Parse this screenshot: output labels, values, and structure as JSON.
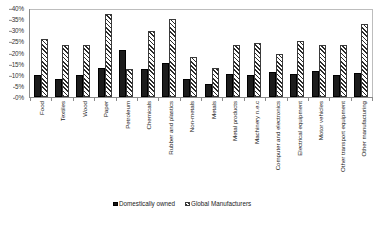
{
  "chart_data": {
    "type": "bar",
    "title": "",
    "subtitle": "",
    "xlabel": "",
    "ylabel": "",
    "ylim": [
      0,
      40
    ],
    "ytick_step": 5,
    "ytick_labels": [
      "0%",
      "5%",
      "10%",
      "15%",
      "20%",
      "25%",
      "30%",
      "35%",
      "40%"
    ],
    "ytick_values": [
      0,
      5,
      10,
      15,
      20,
      25,
      30,
      35,
      40
    ],
    "grid": false,
    "legend_position": "bottom",
    "value_unit": "%",
    "categories": [
      "Food",
      "Textiles",
      "Wood",
      "Paper",
      "Petroleum",
      "Chemicals",
      "Rubber and plastics",
      "Non-metals",
      "Metals",
      "Metal products",
      "Machinery n.e.c",
      "Computer and electronics",
      "Electrical equipment",
      "Motor vehicles",
      "Other transport equipment",
      "Other manufacturing"
    ],
    "series": [
      {
        "name": "Domestically owned",
        "pattern": "solid",
        "color": "#1c1c1c",
        "values": [
          9.8,
          8.3,
          10.1,
          12.9,
          21.1,
          12.4,
          15.5,
          8.2,
          5.8,
          10.4,
          10.0,
          11.3,
          10.2,
          11.6,
          10.1,
          10.6
        ]
      },
      {
        "name": "Global Manufacturers",
        "pattern": "diagonal-hatch",
        "color": "#2b2b2b",
        "values": [
          26.2,
          23.4,
          23.4,
          37.4,
          12.5,
          29.6,
          35.0,
          18.0,
          12.9,
          23.3,
          24.1,
          19.4,
          25.1,
          23.4,
          23.5,
          32.8
        ]
      }
    ]
  },
  "legend": {
    "items": [
      {
        "label": "Domestically owned",
        "swatch": "solid-black-square"
      },
      {
        "label": "Global Manufacturers",
        "swatch": "hatched-square"
      }
    ]
  }
}
